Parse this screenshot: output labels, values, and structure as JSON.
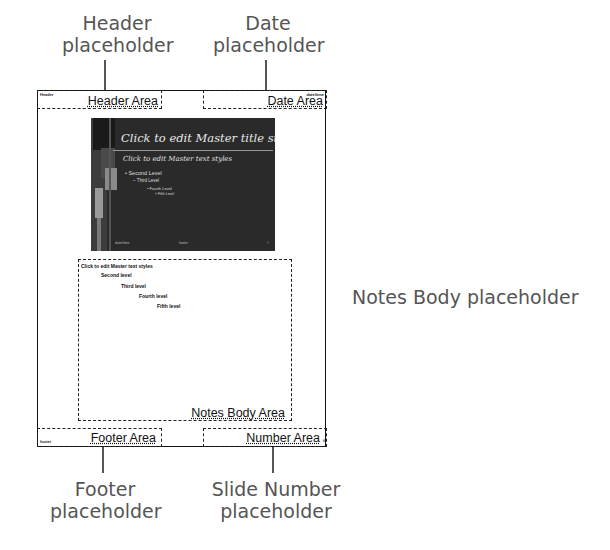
{
  "callouts": {
    "header": [
      "Header",
      "placeholder"
    ],
    "date": [
      "Date",
      "placeholder"
    ],
    "notes_body": "Notes Body placeholder",
    "footer": [
      "Footer",
      "placeholder"
    ],
    "slide_number": [
      "Slide Number",
      "placeholder"
    ]
  },
  "notes_page": {
    "header_area": {
      "label": "Header Area",
      "tiny": "Header"
    },
    "date_area": {
      "label": "Date Area",
      "tiny": "date/time"
    },
    "footer_area": {
      "label": "Footer Area",
      "tiny": "footer"
    },
    "number_area": {
      "label": "Number Area",
      "tiny": "#"
    },
    "notes_body_area": {
      "label": "Notes Body Area",
      "levels": [
        "Click to edit Master text styles",
        "Second level",
        "Third level",
        "Fourth level",
        "Fifth level"
      ]
    },
    "slide_thumbnail": {
      "title": "Click to edit Master title style",
      "level1": "Click to edit Master text styles",
      "level2": "• Second Level",
      "level3": "– Third Level",
      "level4": "• Fourth Level",
      "level5": "» Fifth Level",
      "footer_left": "date/time",
      "footer_center": "footer",
      "footer_right": "#"
    }
  },
  "colors": {
    "callout_text": "#555555",
    "slide_bg": "#2a2a2a",
    "border": "#111111"
  }
}
